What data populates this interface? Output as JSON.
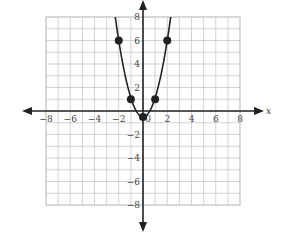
{
  "chart_data": {
    "type": "line",
    "title": "",
    "xlabel": "x",
    "ylabel": "",
    "xlim": [
      -8,
      8
    ],
    "ylim": [
      -8,
      8
    ],
    "grid": true,
    "x_ticks": [
      -8,
      -6,
      -4,
      -2,
      0,
      2,
      4,
      6,
      8
    ],
    "y_ticks": [
      -8,
      -6,
      -4,
      -2,
      2,
      4,
      6,
      8
    ],
    "x_tick_labels": [
      "−8",
      "−6",
      "−4",
      "−2",
      "0",
      "2",
      "4",
      "6",
      "8"
    ],
    "y_tick_labels": [
      "−8",
      "−6",
      "−4",
      "−2",
      "2",
      "4",
      "6",
      "8"
    ],
    "series": [
      {
        "name": "parabola",
        "curve": "y = 1.5x^2 - 0.5 (approximate, opens upward)",
        "points": [
          {
            "x": -2,
            "y": 6
          },
          {
            "x": -1,
            "y": 1
          },
          {
            "x": 0,
            "y": -0.5
          },
          {
            "x": 1,
            "y": 1
          },
          {
            "x": 2,
            "y": 6
          }
        ]
      }
    ],
    "colors": {
      "grid": "#c8c8c8",
      "axis": "#222222",
      "curve": "#222222",
      "points": "#222222"
    }
  }
}
